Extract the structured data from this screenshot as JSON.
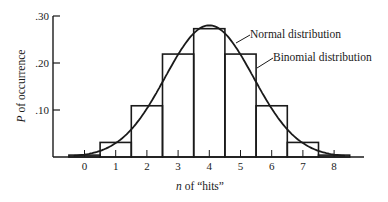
{
  "chart_data": {
    "type": "bar",
    "title": "",
    "xlabel": "n of “hits”",
    "xlabel_italic_part": "n",
    "xlabel_rest": " of “hits”",
    "ylabel": "P of occurrence",
    "ylabel_italic_part": "P",
    "ylabel_rest": " of occurrence",
    "ylim": [
      0,
      0.3
    ],
    "yticks": [
      0.1,
      0.2,
      0.3
    ],
    "ytick_labels": [
      ".10",
      ".20",
      ".30"
    ],
    "categories": [
      "0",
      "1",
      "2",
      "3",
      "4",
      "5",
      "6",
      "7",
      "8"
    ],
    "series": [
      {
        "name": "Binomial distribution",
        "style": "histogram",
        "values": [
          0.004,
          0.031,
          0.109,
          0.219,
          0.273,
          0.219,
          0.109,
          0.031,
          0.004
        ]
      },
      {
        "name": "Normal distribution",
        "style": "curve",
        "mean": 4,
        "sd": 1.414,
        "peak": 0.28
      }
    ],
    "annotations": [
      {
        "text": "Normal distribution",
        "target": "curve"
      },
      {
        "text": "Binomial distribution",
        "target": "bars"
      }
    ],
    "grid": false,
    "legend": "inline annotations"
  }
}
